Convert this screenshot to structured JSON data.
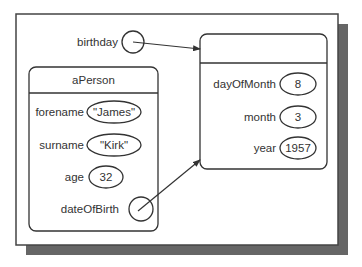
{
  "colors": {
    "line": "#333333",
    "shadow": "#666666",
    "background": "#ffffff"
  },
  "variable": {
    "label": "birthday"
  },
  "person": {
    "title": "aPerson",
    "fields": [
      {
        "name": "forename",
        "value": "\"James\""
      },
      {
        "name": "surname",
        "value": "\"Kirk\""
      },
      {
        "name": "age",
        "value": "32"
      },
      {
        "name": "dateOfBirth",
        "value": ""
      }
    ]
  },
  "date": {
    "title": "",
    "fields": [
      {
        "name": "dayOfMonth",
        "value": "8"
      },
      {
        "name": "month",
        "value": "3"
      },
      {
        "name": "year",
        "value": "1957"
      }
    ]
  }
}
